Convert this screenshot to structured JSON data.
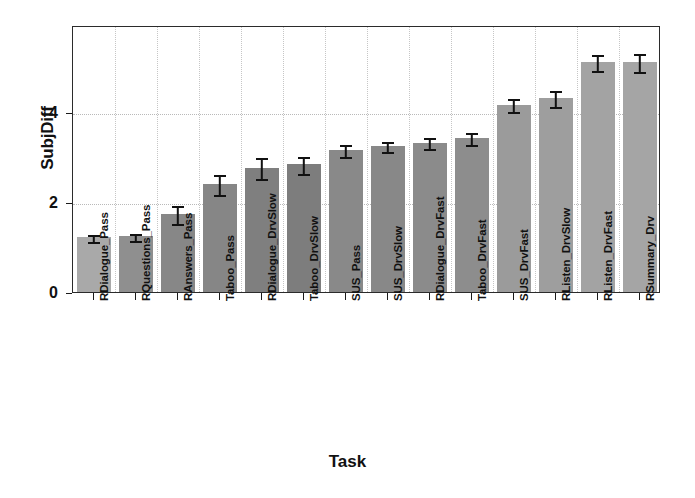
{
  "chart_data": {
    "type": "bar",
    "title": "",
    "xlabel": "Task",
    "ylabel": "SubjDiff",
    "ylim": [
      0,
      5.93
    ],
    "yticks": [
      0,
      2,
      4
    ],
    "ytick_labels": [
      "0",
      "2",
      "4"
    ],
    "grid": true,
    "legend": "none",
    "error_bar_type": "symmetric",
    "categories": [
      "RDialogue_Pass",
      "RQuestions_Pass",
      "RAnswers_Pass",
      "Taboo_Pass",
      "RDialogue_DrvSlow",
      "Taboo_DrvSlow",
      "SUS_Pass",
      "SUS_DrvSlow",
      "RDialogue_DrvFast",
      "Taboo_DrvFast",
      "SUS_DrvFast",
      "RListen_DrvSlow",
      "RListen_DrvFast",
      "RSummary_Drv"
    ],
    "values": [
      1.22,
      1.24,
      1.74,
      2.4,
      2.76,
      2.84,
      3.15,
      3.24,
      3.32,
      3.42,
      4.16,
      4.3,
      5.1,
      5.1
    ],
    "errors": [
      0.1,
      0.1,
      0.22,
      0.24,
      0.26,
      0.21,
      0.16,
      0.14,
      0.15,
      0.16,
      0.16,
      0.2,
      0.2,
      0.22
    ],
    "bar_colors": [
      "#a9a9a9",
      "#8f8f8f",
      "#878787",
      "#868686",
      "#7f7f7f",
      "#7d7d7d",
      "#898989",
      "#888888",
      "#8b8b8b",
      "#8d8d8d",
      "#9b9b9b",
      "#9e9e9e",
      "#a3a3a3",
      "#a5a5a5"
    ],
    "error_color": "#111111",
    "axis_color": "#2b2b2b",
    "grid_color": "#bdbdbd",
    "background": "#ffffff"
  }
}
